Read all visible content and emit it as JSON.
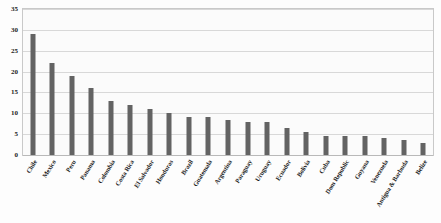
{
  "chart_data": {
    "type": "bar",
    "title": "",
    "xlabel": "",
    "ylabel": "",
    "ylim": [
      0,
      35
    ],
    "ytick_step": 5,
    "yticks": [
      0,
      5,
      10,
      15,
      20,
      25,
      30,
      35
    ],
    "grid": true,
    "legend": "none",
    "orientation": "vertical",
    "bar_color": "#636363",
    "categories": [
      "Chile",
      "Mexico",
      "Peru",
      "Panama",
      "Colombia",
      "Costa Rica",
      "El Salvador",
      "Honduras",
      "Brazil",
      "Guatemala",
      "Argentina",
      "Paraguay",
      "Uruguay",
      "Ecuador",
      "Bolivia",
      "Cuba",
      "Dom Republic",
      "Guyana",
      "Venezuela",
      "Antigua & Barbuda",
      "Belize"
    ],
    "values": [
      29,
      22,
      19,
      16,
      13,
      12,
      11,
      10,
      9,
      9,
      8.5,
      8,
      8,
      6.5,
      5.5,
      4.5,
      4.5,
      4.5,
      4,
      3.5,
      3
    ]
  },
  "colors": {
    "bar": "#636363",
    "gridline": "#d8d8d8",
    "frame": "#c9c9c9",
    "plot_background": "#fbfbfb",
    "text": "#1b1b1b"
  }
}
